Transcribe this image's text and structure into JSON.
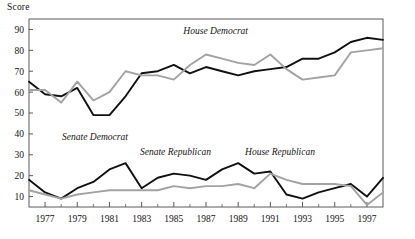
{
  "chart_data": {
    "type": "line",
    "title": "",
    "ylabel": "Score",
    "xlabel": "",
    "xlim": [
      1976,
      1998
    ],
    "ylim": [
      5,
      95
    ],
    "yticks": [
      10,
      20,
      30,
      40,
      50,
      60,
      70,
      80,
      90
    ],
    "xticks": [
      1977,
      1979,
      1981,
      1983,
      1985,
      1987,
      1989,
      1991,
      1993,
      1995,
      1997
    ],
    "xtick_labels": [
      "1977",
      "1979",
      "1981",
      "1983",
      "1985",
      "1987",
      "1989",
      "1991",
      "1993",
      "1995",
      "1997"
    ],
    "ytick_labels": [
      "10",
      "20",
      "30",
      "40",
      "50",
      "60",
      "70",
      "80",
      "90"
    ],
    "minor_xticks": [
      1978,
      1980,
      1982,
      1984,
      1986,
      1988,
      1990,
      1992,
      1994,
      1996
    ],
    "grid": false,
    "legend_position": "inline-annotations",
    "x": [
      1976,
      1977,
      1978,
      1979,
      1980,
      1981,
      1982,
      1983,
      1984,
      1985,
      1986,
      1987,
      1988,
      1989,
      1990,
      1991,
      1992,
      1993,
      1994,
      1995,
      1996,
      1997,
      1998
    ],
    "series": [
      {
        "name": "Senate Democrat",
        "color": "#111111",
        "style": "solid",
        "label_x": 1980.1,
        "label_y": 37,
        "values": [
          65,
          59,
          58,
          62,
          49,
          49,
          58,
          69,
          70,
          73,
          69,
          72,
          70,
          68,
          70,
          71,
          72,
          76,
          76,
          79,
          84,
          86,
          85
        ]
      },
      {
        "name": "House Democrat",
        "color": "#a2a2a2",
        "style": "solid",
        "label_x": 1987.6,
        "label_y": 88,
        "values": [
          61,
          61,
          55,
          65,
          56,
          60,
          70,
          68,
          68,
          66,
          73,
          78,
          76,
          74,
          73,
          78,
          71,
          66,
          67,
          68,
          79,
          80,
          81
        ]
      },
      {
        "name": "Senate Republican",
        "color": "#111111",
        "style": "solid",
        "label_x": 1985.1,
        "label_y": 30,
        "values": [
          18,
          12,
          9,
          14,
          17,
          23,
          26,
          14,
          19,
          21,
          20,
          18,
          23,
          26,
          21,
          22,
          11,
          9,
          12,
          14,
          16,
          10,
          19
        ]
      },
      {
        "name": "House Republican",
        "color": "#a2a2a2",
        "style": "solid",
        "label_x": 1991.6,
        "label_y": 30,
        "values": [
          13,
          11,
          9,
          11,
          12,
          13,
          13,
          13,
          13,
          15,
          14,
          15,
          15,
          16,
          14,
          21,
          18,
          16,
          16,
          16,
          15,
          6,
          12
        ]
      }
    ]
  }
}
